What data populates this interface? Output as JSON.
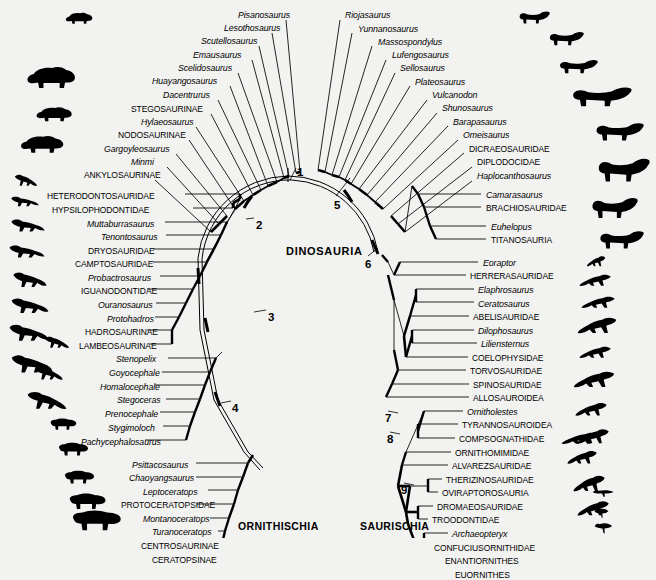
{
  "figure": {
    "type": "phylogenetic-cladogram",
    "layout": "radial-fan",
    "root_label": "DINOSAURIA",
    "background_color": "#f2f2f0",
    "line_color": "#000000",
    "width": 656,
    "height": 538
  },
  "major_clades": [
    {
      "id": "ornithischia",
      "label": "ORNITHISCHIA",
      "x": 238,
      "y": 520
    },
    {
      "id": "saurischia",
      "label": "SAURISCHIA",
      "x": 360,
      "y": 520
    }
  ],
  "root": {
    "label": "DINOSAURIA",
    "x": 286,
    "y": 245
  },
  "node_numbers": [
    {
      "label": "1",
      "x": 297,
      "y": 166,
      "target_x": 292,
      "target_y": 182
    },
    {
      "label": "2",
      "x": 256,
      "y": 219,
      "target_x": 243,
      "target_y": 221
    },
    {
      "label": "3",
      "x": 268,
      "y": 311,
      "target_x": 252,
      "target_y": 312
    },
    {
      "label": "4",
      "x": 232,
      "y": 402,
      "target_x": 219,
      "target_y": 404
    },
    {
      "label": "5",
      "x": 334,
      "y": 199,
      "target_x": 350,
      "target_y": 177
    },
    {
      "label": "6",
      "x": 365,
      "y": 258,
      "target_x": 378,
      "target_y": 247
    },
    {
      "label": "7",
      "x": 385,
      "y": 412,
      "target_x": 398,
      "target_y": 414
    },
    {
      "label": "8",
      "x": 387,
      "y": 433,
      "target_x": 400,
      "target_y": 434
    },
    {
      "label": "9",
      "x": 401,
      "y": 484,
      "target_x": 414,
      "target_y": 485
    }
  ],
  "ornithischia_tips": [
    {
      "name": "Pisanosaurus",
      "style": "genus",
      "x": 238,
      "y": 16
    },
    {
      "name": "Lesothosaurus",
      "style": "genus",
      "x": 224,
      "y": 29
    },
    {
      "name": "Scutellosaurus",
      "style": "genus",
      "x": 201,
      "y": 42
    },
    {
      "name": "Emausaurus",
      "style": "genus",
      "x": 193,
      "y": 56
    },
    {
      "name": "Scelidosaurus",
      "style": "genus",
      "x": 178,
      "y": 69
    },
    {
      "name": "Huayangosaurus",
      "style": "genus",
      "x": 152,
      "y": 82
    },
    {
      "name": "Dacentrurus",
      "style": "genus",
      "x": 163,
      "y": 96
    },
    {
      "name": "STEGOSAURINAE",
      "style": "clade",
      "x": 131,
      "y": 110
    },
    {
      "name": "Hylaeosaurus",
      "style": "genus",
      "x": 141,
      "y": 123
    },
    {
      "name": "NODOSAURINAE",
      "style": "clade",
      "x": 118,
      "y": 136
    },
    {
      "name": "Gargoyleosaurus",
      "style": "genus",
      "x": 104,
      "y": 150
    },
    {
      "name": "Minmi",
      "style": "genus",
      "x": 131,
      "y": 163
    },
    {
      "name": "ANKYLOSAURINAE",
      "style": "clade",
      "x": 84,
      "y": 176
    },
    {
      "name": "HETERODONTOSAURIDAE",
      "style": "clade",
      "x": 47,
      "y": 197
    },
    {
      "name": "HYPSILOPHODONTIDAE",
      "style": "clade",
      "x": 52,
      "y": 211
    },
    {
      "name": "Muttaburrasaurus",
      "style": "genus",
      "x": 87,
      "y": 225
    },
    {
      "name": "Tenontosaurus",
      "style": "genus",
      "x": 101,
      "y": 238
    },
    {
      "name": "DRYOSAURIDAE",
      "style": "clade",
      "x": 88,
      "y": 252
    },
    {
      "name": "CAMPTOSAURIDAE",
      "style": "clade",
      "x": 75,
      "y": 265
    },
    {
      "name": "Probactrosaurus",
      "style": "genus",
      "x": 88,
      "y": 279
    },
    {
      "name": "IGUANODONTIDAE",
      "style": "clade",
      "x": 81,
      "y": 292
    },
    {
      "name": "Ouranosaurus",
      "style": "genus",
      "x": 98,
      "y": 306
    },
    {
      "name": "Protohadros",
      "style": "genus",
      "x": 107,
      "y": 320
    },
    {
      "name": "HADROSAURINAE",
      "style": "clade",
      "x": 85,
      "y": 333
    },
    {
      "name": "LAMBEOSAURINAE",
      "style": "clade",
      "x": 79,
      "y": 347
    },
    {
      "name": "Stenopelix",
      "style": "genus",
      "x": 116,
      "y": 360
    },
    {
      "name": "Goyocephale",
      "style": "genus",
      "x": 109,
      "y": 374
    },
    {
      "name": "Homalocephale",
      "style": "genus",
      "x": 100,
      "y": 388
    },
    {
      "name": "Stegoceras",
      "style": "genus",
      "x": 117,
      "y": 401
    },
    {
      "name": "Prenocephale",
      "style": "genus",
      "x": 105,
      "y": 415
    },
    {
      "name": "Stygimoloch",
      "style": "genus",
      "x": 108,
      "y": 429
    },
    {
      "name": "Pachycephalosaurus",
      "style": "genus",
      "x": 81,
      "y": 443
    },
    {
      "name": "Psittacosaurus",
      "style": "genus",
      "x": 132,
      "y": 466
    },
    {
      "name": "Chaoyangsaurus",
      "style": "genus",
      "x": 129,
      "y": 479
    },
    {
      "name": "Leptoceratops",
      "style": "genus",
      "x": 143,
      "y": 493
    },
    {
      "name": "PROTOCERATOPSIDAE",
      "style": "clade",
      "x": 121,
      "y": 506
    },
    {
      "name": "Montanoceratops",
      "style": "genus",
      "x": 143,
      "y": 520
    },
    {
      "name": "Turanoceratops",
      "style": "genus",
      "x": 152,
      "y": 533
    },
    {
      "name": "CENTROSAURINAE",
      "style": "clade",
      "x": 141,
      "y": 547
    },
    {
      "name": "CERATOPSINAE",
      "style": "clade",
      "x": 152,
      "y": 561
    }
  ],
  "saurischia_tips": [
    {
      "name": "Riojasaurus",
      "style": "genus",
      "x": 345,
      "y": 16
    },
    {
      "name": "Yunnanosaurus",
      "style": "genus",
      "x": 358,
      "y": 30
    },
    {
      "name": "Massospondylus",
      "style": "genus",
      "x": 378,
      "y": 43
    },
    {
      "name": "Lufengosaurus",
      "style": "genus",
      "x": 392,
      "y": 56
    },
    {
      "name": "Sellosaurus",
      "style": "genus",
      "x": 400,
      "y": 69
    },
    {
      "name": "Plateosaurus",
      "style": "genus",
      "x": 415,
      "y": 83
    },
    {
      "name": "Vulcanodon",
      "style": "genus",
      "x": 432,
      "y": 96
    },
    {
      "name": "Shunosaurus",
      "style": "genus",
      "x": 442,
      "y": 109
    },
    {
      "name": "Barapasaurus",
      "style": "genus",
      "x": 453,
      "y": 123
    },
    {
      "name": "Omeisaurus",
      "style": "genus",
      "x": 463,
      "y": 136
    },
    {
      "name": "DICRAEOSAURIDAE",
      "style": "clade",
      "x": 469,
      "y": 150
    },
    {
      "name": "DIPLODOCIDAE",
      "style": "clade",
      "x": 477,
      "y": 163
    },
    {
      "name": "Haplocanthosaurus",
      "style": "genus",
      "x": 477,
      "y": 177
    },
    {
      "name": "Camarasaurus",
      "style": "genus",
      "x": 486,
      "y": 196
    },
    {
      "name": "BRACHIOSAURIDAE",
      "style": "clade",
      "x": 486,
      "y": 209
    },
    {
      "name": "Euhelopus",
      "style": "genus",
      "x": 491,
      "y": 228
    },
    {
      "name": "TITANOSAURIA",
      "style": "clade",
      "x": 491,
      "y": 241
    },
    {
      "name": "Eoraptor",
      "style": "genus",
      "x": 483,
      "y": 264
    },
    {
      "name": "HERRERASAURIDAE",
      "style": "clade",
      "x": 470,
      "y": 277
    },
    {
      "name": "Elaphrosaurus",
      "style": "genus",
      "x": 478,
      "y": 291
    },
    {
      "name": "Ceratosaurus",
      "style": "genus",
      "x": 478,
      "y": 305
    },
    {
      "name": "ABELISAURIDAE",
      "style": "clade",
      "x": 473,
      "y": 318
    },
    {
      "name": "Dilophosaurus",
      "style": "genus",
      "x": 478,
      "y": 332
    },
    {
      "name": "Liliensternus",
      "style": "genus",
      "x": 481,
      "y": 345
    },
    {
      "name": "COELOPHYSIDAE",
      "style": "clade",
      "x": 472,
      "y": 359
    },
    {
      "name": "TORVOSAURIDAE",
      "style": "clade",
      "x": 470,
      "y": 372
    },
    {
      "name": "SPINOSAURIDAE",
      "style": "clade",
      "x": 473,
      "y": 386
    },
    {
      "name": "ALLOSAUROIDEA",
      "style": "clade",
      "x": 473,
      "y": 399
    },
    {
      "name": "Ornitholestes",
      "style": "genus",
      "x": 467,
      "y": 413
    },
    {
      "name": "TYRANNOSAUROIDEA",
      "style": "clade",
      "x": 462,
      "y": 426
    },
    {
      "name": "COMPSOGNATHIDAE",
      "style": "clade",
      "x": 459,
      "y": 440
    },
    {
      "name": "ORNITHOMIMIDAE",
      "style": "clade",
      "x": 455,
      "y": 454
    },
    {
      "name": "ALVAREZSAURIDAE",
      "style": "clade",
      "x": 452,
      "y": 467
    },
    {
      "name": "THERIZINOSAURIDAE",
      "style": "clade",
      "x": 446,
      "y": 481
    },
    {
      "name": "OVIRAPTOROSAURIA",
      "style": "clade",
      "x": 442,
      "y": 494
    },
    {
      "name": "DROMAEOSAURIDAE",
      "style": "clade",
      "x": 437,
      "y": 508
    },
    {
      "name": "TROODONTIDAE",
      "style": "clade",
      "x": 432,
      "y": 521
    },
    {
      "name": "Archaeopteryx",
      "style": "genus",
      "x": 452,
      "y": 535
    },
    {
      "name": "CONFUCIUSORNITHIDAE",
      "style": "clade",
      "x": 434,
      "y": 549
    },
    {
      "name": "ENANTIORNITHES",
      "style": "clade",
      "x": 445,
      "y": 562
    },
    {
      "name": "EUORNITHES",
      "style": "clade",
      "x": 455,
      "y": 576
    }
  ],
  "silhouettes_left": [
    {
      "taxon": "stegosaur-small",
      "x": 64,
      "y": 10,
      "w": 30,
      "h": 16
    },
    {
      "taxon": "stegosaur-large",
      "x": 24,
      "y": 62,
      "w": 54,
      "h": 30
    },
    {
      "taxon": "nodosaur",
      "x": 34,
      "y": 104,
      "w": 40,
      "h": 20
    },
    {
      "taxon": "ankylosaur",
      "x": 18,
      "y": 132,
      "w": 48,
      "h": 24
    },
    {
      "taxon": "heterodontosaur",
      "x": 14,
      "y": 172,
      "w": 24,
      "h": 16
    },
    {
      "taxon": "hypsilophodont",
      "x": 10,
      "y": 194,
      "w": 30,
      "h": 14
    },
    {
      "taxon": "muttaburrasaur",
      "x": 10,
      "y": 216,
      "w": 36,
      "h": 18
    },
    {
      "taxon": "tenontosaur",
      "x": 8,
      "y": 242,
      "w": 38,
      "h": 18
    },
    {
      "taxon": "dryosaur",
      "x": 12,
      "y": 268,
      "w": 36,
      "h": 22
    },
    {
      "taxon": "camptosaur",
      "x": 10,
      "y": 294,
      "w": 40,
      "h": 22
    },
    {
      "taxon": "iguanodont",
      "x": 8,
      "y": 320,
      "w": 42,
      "h": 24
    },
    {
      "taxon": "hadrosaur",
      "x": 10,
      "y": 350,
      "w": 44,
      "h": 26
    },
    {
      "taxon": "pachycephalosaur-small",
      "x": 44,
      "y": 334,
      "w": 26,
      "h": 16
    },
    {
      "taxon": "pachycephalosaur",
      "x": 34,
      "y": 364,
      "w": 30,
      "h": 18
    },
    {
      "taxon": "pachycephalosaur-big",
      "x": 26,
      "y": 388,
      "w": 42,
      "h": 24
    },
    {
      "taxon": "psittacosaur",
      "x": 48,
      "y": 416,
      "w": 30,
      "h": 16
    },
    {
      "taxon": "protoceratops",
      "x": 56,
      "y": 440,
      "w": 34,
      "h": 18
    },
    {
      "taxon": "montanoceratops",
      "x": 62,
      "y": 468,
      "w": 34,
      "h": 18
    },
    {
      "taxon": "centrosaur",
      "x": 66,
      "y": 490,
      "w": 42,
      "h": 22
    },
    {
      "taxon": "ceratopsian-large",
      "x": 68,
      "y": 506,
      "w": 56,
      "h": 28
    }
  ],
  "silhouettes_right": [
    {
      "taxon": "prosauropod-small",
      "x": 518,
      "y": 8,
      "w": 32,
      "h": 18
    },
    {
      "taxon": "prosauropod",
      "x": 548,
      "y": 28,
      "w": 36,
      "h": 20
    },
    {
      "taxon": "sauropod-small",
      "x": 558,
      "y": 56,
      "w": 40,
      "h": 20
    },
    {
      "taxon": "sauropod-medium",
      "x": 570,
      "y": 82,
      "w": 62,
      "h": 28
    },
    {
      "taxon": "sauropod-diplodocid",
      "x": 594,
      "y": 118,
      "w": 50,
      "h": 26
    },
    {
      "taxon": "sauropod-large",
      "x": 596,
      "y": 152,
      "w": 54,
      "h": 34
    },
    {
      "taxon": "brachiosaur",
      "x": 590,
      "y": 192,
      "w": 48,
      "h": 30
    },
    {
      "taxon": "titanosaur",
      "x": 598,
      "y": 226,
      "w": 46,
      "h": 26
    },
    {
      "taxon": "eoraptor",
      "x": 586,
      "y": 254,
      "w": 20,
      "h": 14
    },
    {
      "taxon": "herrerasaur",
      "x": 578,
      "y": 272,
      "w": 34,
      "h": 16
    },
    {
      "taxon": "elaphrosaur",
      "x": 580,
      "y": 294,
      "w": 36,
      "h": 16
    },
    {
      "taxon": "ceratosaur",
      "x": 576,
      "y": 314,
      "w": 42,
      "h": 22
    },
    {
      "taxon": "dilophosaur",
      "x": 578,
      "y": 344,
      "w": 34,
      "h": 16
    },
    {
      "taxon": "spinosaur",
      "x": 572,
      "y": 368,
      "w": 44,
      "h": 22
    },
    {
      "taxon": "allosaur",
      "x": 574,
      "y": 400,
      "w": 34,
      "h": 18
    },
    {
      "taxon": "tyrannosaur",
      "x": 576,
      "y": 426,
      "w": 34,
      "h": 20
    },
    {
      "taxon": "compsognathid",
      "x": 566,
      "y": 448,
      "w": 32,
      "h": 18
    },
    {
      "taxon": "ornithomimid",
      "x": 572,
      "y": 472,
      "w": 34,
      "h": 22
    },
    {
      "taxon": "therizinosaur",
      "x": 576,
      "y": 498,
      "w": 34,
      "h": 20
    },
    {
      "taxon": "dromaeosaur",
      "x": 560,
      "y": 430,
      "w": 40,
      "h": 16
    },
    {
      "taxon": "archaeopteryx",
      "x": 592,
      "y": 488,
      "w": 24,
      "h": 12
    },
    {
      "taxon": "confuciusornis",
      "x": 594,
      "y": 506,
      "w": 16,
      "h": 16
    },
    {
      "taxon": "enantiornithes",
      "x": 594,
      "y": 520,
      "w": 20,
      "h": 18
    }
  ]
}
